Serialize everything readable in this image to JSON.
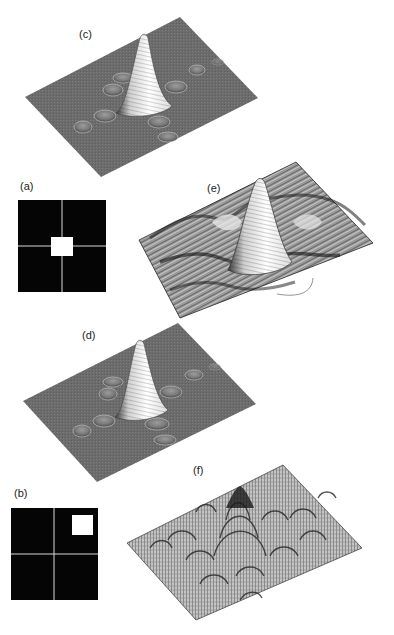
{
  "figure": {
    "panels": [
      {
        "id": "a",
        "label": "(a)",
        "type": "aperture-mask",
        "description": "Black square mask divided into 4 quadrants by thin white lines, with a small white square aperture at the center"
      },
      {
        "id": "b",
        "label": "(b)",
        "type": "aperture-mask",
        "description": "Black square mask divided into 4 quadrants by thin white lines, with a small white square aperture in the upper-right quadrant"
      },
      {
        "id": "c",
        "label": "(c)",
        "type": "surface-plot",
        "description": "3D surface plot of a sinc-like diffraction pattern on a gray plane: tall central peak with small side lobes"
      },
      {
        "id": "d",
        "label": "(d)",
        "type": "surface-plot",
        "description": "3D surface plot nearly identical to (c): central peak with small side lobes"
      },
      {
        "id": "e",
        "label": "(e)",
        "type": "surface-plot",
        "description": "3D mesh surface plot with central peak and pronounced ripples/side ridges"
      },
      {
        "id": "f",
        "label": "(f)",
        "type": "surface-plot",
        "description": "3D mesh surface plot with a central peak and many oscillating lobes (interference pattern)"
      }
    ]
  },
  "colors": {
    "background": "#ffffff",
    "mask_black": "#050505",
    "mask_line": "#d8d8d8",
    "plane_gray": "#6e6e6e",
    "peak_white": "#f4f4f4",
    "mesh_dark": "#2a2a2a",
    "mesh_light": "#b8b8b8"
  }
}
